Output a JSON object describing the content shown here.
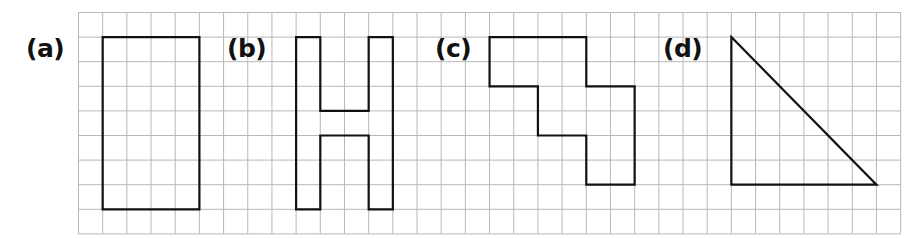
{
  "grid": {
    "origin_x": 78.5,
    "origin_y": 12.5,
    "cols": 34,
    "rows": 9,
    "cell_w": 24.18,
    "cell_h": 24.6,
    "line_color": "#b8b8b8",
    "line_width": 1
  },
  "shape_style": {
    "stroke": "#111111",
    "stroke_width": 2.2,
    "fill": "none"
  },
  "shapes": [
    {
      "id": "a",
      "label": "(a)",
      "label_pos": [
        26,
        34
      ],
      "kind": "rectangle",
      "points": [
        [
          1,
          1
        ],
        [
          5,
          1
        ],
        [
          5,
          8
        ],
        [
          1,
          8
        ]
      ]
    },
    {
      "id": "b",
      "label": "(b)",
      "label_pos": [
        227,
        34
      ],
      "kind": "H-shape",
      "points": [
        [
          9,
          1
        ],
        [
          10,
          1
        ],
        [
          10,
          4
        ],
        [
          12,
          4
        ],
        [
          12,
          1
        ],
        [
          13,
          1
        ],
        [
          13,
          8
        ],
        [
          12,
          8
        ],
        [
          12,
          5
        ],
        [
          10,
          5
        ],
        [
          10,
          8
        ],
        [
          9,
          8
        ]
      ]
    },
    {
      "id": "c",
      "label": "(c)",
      "label_pos": [
        435,
        34
      ],
      "kind": "stepped polygon",
      "points": [
        [
          17,
          1
        ],
        [
          21,
          1
        ],
        [
          21,
          3
        ],
        [
          23,
          3
        ],
        [
          23,
          7
        ],
        [
          21,
          7
        ],
        [
          21,
          5
        ],
        [
          19,
          5
        ],
        [
          19,
          3
        ],
        [
          17,
          3
        ]
      ]
    },
    {
      "id": "d",
      "label": "(d)",
      "label_pos": [
        663,
        34
      ],
      "kind": "right triangle",
      "points": [
        [
          27,
          1
        ],
        [
          33,
          7
        ],
        [
          27,
          7
        ]
      ]
    }
  ]
}
